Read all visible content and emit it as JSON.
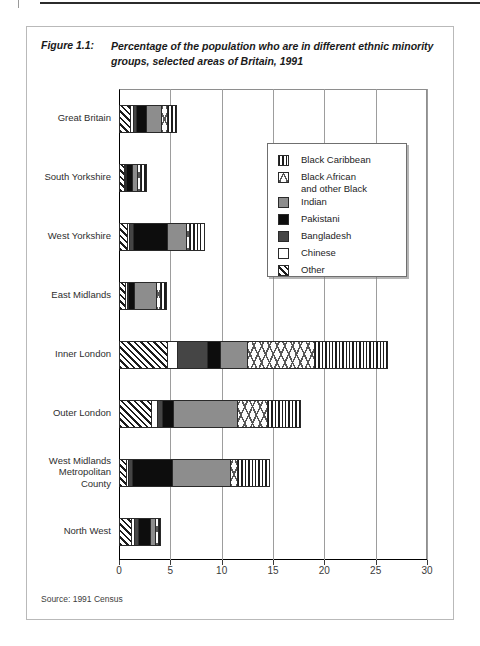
{
  "figure": {
    "label": "Figure 1.1:",
    "title": "Percentage of the population who are in different ethnic minority groups, selected areas of Britain, 1991",
    "source": "Source: 1991 Census"
  },
  "legend": {
    "position": "inside-top-right",
    "entries": [
      {
        "label": "Black Caribbean",
        "pattern": "vertical-stripes",
        "color": "#1c1c1c"
      },
      {
        "label": "Black African\nand other Black",
        "pattern": "crosshatch-dots",
        "color": "#3a3a3a"
      },
      {
        "label": "Indian",
        "pattern": "solid-gray",
        "color": "#8d8d8d"
      },
      {
        "label": "Pakistani",
        "pattern": "solid-black",
        "color": "#0d0d0d"
      },
      {
        "label": "Bangladesh",
        "pattern": "solid-dark-gray",
        "color": "#454545"
      },
      {
        "label": "Chinese",
        "pattern": "solid-white",
        "color": "#ffffff"
      },
      {
        "label": "Other",
        "pattern": "diagonal-stripes",
        "color": "#1c1c1c"
      }
    ]
  },
  "chart_data": {
    "type": "bar",
    "orientation": "horizontal",
    "stacked": true,
    "title": "Percentage of the population who are in different ethnic minority groups, selected areas of Britain, 1991",
    "xlabel": "",
    "ylabel": "",
    "xlim": [
      0,
      30
    ],
    "xticks": [
      0,
      5,
      10,
      15,
      20,
      25,
      30
    ],
    "xtick_labels": [
      "0",
      "5",
      "10",
      "15",
      "20",
      "25",
      "30"
    ],
    "grid": "vertical",
    "legend_entries": [
      "Black Caribbean",
      "Black African and other Black",
      "Indian",
      "Pakistani",
      "Bangladesh",
      "Chinese",
      "Other"
    ],
    "categories": [
      "Great Britain",
      "South Yorkshire",
      "West Yorkshire",
      "East Midlands",
      "Inner London",
      "Outer London",
      "West Midlands Metropolitan County",
      "North West"
    ],
    "segment_order_left_to_right": [
      "Other",
      "Chinese",
      "Bangladesh",
      "Pakistani",
      "Indian",
      "Black African and other Black",
      "Black Caribbean"
    ],
    "series": [
      {
        "name": "Other",
        "values": [
          1.0,
          0.4,
          0.7,
          0.5,
          4.6,
          3.0,
          0.6,
          1.1
        ]
      },
      {
        "name": "Chinese",
        "values": [
          0.3,
          0.1,
          0.2,
          0.2,
          1.0,
          0.6,
          0.2,
          0.3
        ]
      },
      {
        "name": "Bangladesh",
        "values": [
          0.3,
          0.1,
          0.4,
          0.1,
          2.9,
          0.5,
          0.4,
          0.4
        ]
      },
      {
        "name": "Pakistani",
        "values": [
          0.9,
          0.6,
          3.3,
          0.6,
          1.2,
          1.1,
          3.9,
          1.1
        ]
      },
      {
        "name": "Indian",
        "values": [
          1.5,
          0.5,
          1.8,
          2.1,
          2.7,
          6.2,
          5.6,
          0.5
        ]
      },
      {
        "name": "Black African and other Black",
        "values": [
          0.6,
          0.3,
          0.3,
          0.4,
          6.5,
          2.9,
          0.7,
          0.3
        ]
      },
      {
        "name": "Black Caribbean",
        "values": [
          0.9,
          0.5,
          1.5,
          0.6,
          7.1,
          3.2,
          3.1,
          0.2
        ]
      }
    ],
    "totals": [
      5.5,
      2.5,
      8.2,
      4.5,
      26.0,
      17.5,
      14.5,
      3.9
    ]
  }
}
